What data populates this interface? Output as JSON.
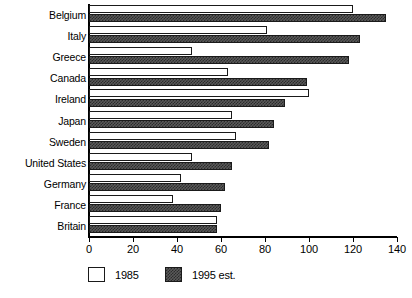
{
  "chart_data": {
    "type": "bar",
    "orientation": "horizontal",
    "title": "",
    "subtitle": "",
    "xlabel": "",
    "ylabel": "",
    "xlim": [
      0,
      140
    ],
    "xticks": [
      0,
      20,
      40,
      60,
      80,
      100,
      120,
      140
    ],
    "xtick_labels": [
      "0",
      "20",
      "40",
      "60",
      "80",
      "100",
      "120",
      "140"
    ],
    "grid": false,
    "legend_position": "bottom-left",
    "categories": [
      "Belgium",
      "Italy",
      "Greece",
      "Canada",
      "Ireland",
      "Japan",
      "Sweden",
      "United States",
      "Germany",
      "France",
      "Britain"
    ],
    "series": [
      {
        "name": "1985",
        "color": "#ffffff",
        "pattern": "solid-white",
        "values": [
          120,
          81,
          47,
          63,
          100,
          65,
          67,
          47,
          42,
          38,
          58
        ]
      },
      {
        "name": "1995 est.",
        "color": "#4d4d4d",
        "pattern": "checkered-dark",
        "values": [
          135,
          123,
          118,
          99,
          89,
          84,
          82,
          65,
          62,
          60,
          58
        ]
      }
    ],
    "legend": [
      {
        "label": "1985",
        "swatch": "white"
      },
      {
        "label": "1995 est.",
        "swatch": "hatched-dark"
      }
    ]
  }
}
